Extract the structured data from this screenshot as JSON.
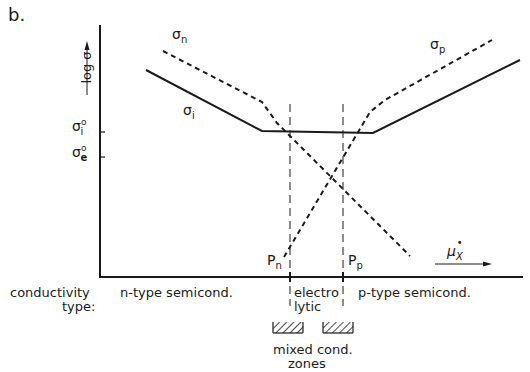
{
  "figure": {
    "panel_label": "b.",
    "y_axis": {
      "label": "log σ",
      "ticks": [
        {
          "symbol": "σ",
          "sub": "i",
          "sup": "o",
          "name": "sigma-i-zero"
        },
        {
          "symbol": "σ",
          "sub": "e",
          "sup": "o",
          "name": "sigma-e-zero"
        }
      ]
    },
    "x_axis": {
      "label_symbol": "μ",
      "label_sub": "X",
      "label_sup": "•",
      "markers": [
        {
          "symbol": "P",
          "sub": "n"
        },
        {
          "symbol": "P",
          "sub": "p"
        }
      ]
    },
    "curves": [
      {
        "symbol": "σ",
        "sub": "n",
        "style": "dashed",
        "description": "n-type conductivity"
      },
      {
        "symbol": "σ",
        "sub": "p",
        "style": "dashed",
        "description": "p-type conductivity"
      },
      {
        "symbol": "σ",
        "sub": "i",
        "style": "solid",
        "description": "ionic / total conductivity"
      }
    ],
    "conductivity_type": {
      "label_line1": "conductivity",
      "label_line2": "type:",
      "regions": [
        {
          "text": "n-type semicond."
        },
        {
          "text_line1": "electro",
          "text_line2": "lytic"
        },
        {
          "text": "p-type semicond."
        }
      ]
    },
    "mixed_zones": {
      "label_line1": "mixed cond.",
      "label_line2": "zones"
    }
  }
}
